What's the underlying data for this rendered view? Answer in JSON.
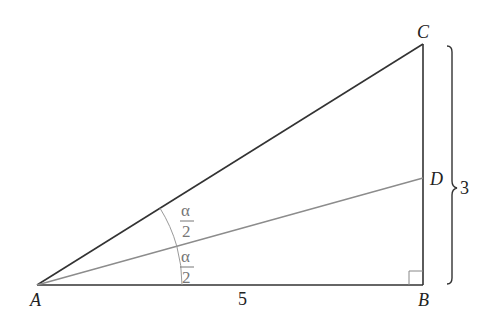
{
  "diagram": {
    "type": "right-triangle-angle-bisector",
    "points": {
      "A": {
        "label": "A",
        "x": 37,
        "y": 285
      },
      "B": {
        "label": "B",
        "x": 423,
        "y": 285
      },
      "C": {
        "label": "C",
        "x": 423,
        "y": 44
      },
      "D": {
        "label": "D",
        "x": 423,
        "y": 178
      }
    },
    "labels": {
      "A": "A",
      "B": "B",
      "C": "C",
      "D": "D",
      "base_length": "5",
      "height_length": "3",
      "half_angle_top_num": "α",
      "half_angle_top_den": "2",
      "half_angle_bottom_num": "α",
      "half_angle_bottom_den": "2"
    },
    "colors": {
      "sides": "#333333",
      "bisector": "#8c8c8c",
      "arcs": "#9a9a9a",
      "angle_labels": "#777777"
    }
  }
}
